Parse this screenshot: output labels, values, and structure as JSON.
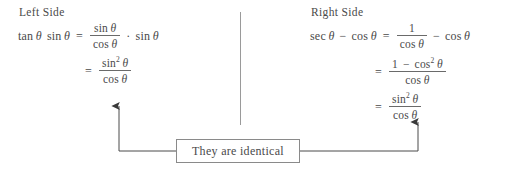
{
  "page": {
    "background_color": "#ffffff",
    "ink_color": "#4a4a4a",
    "rule_color": "#8a8a8a"
  },
  "left": {
    "heading": "Left Side",
    "lines": [
      {
        "lhs": "tan θ sin θ",
        "relation": "=",
        "rhs_text": "(sin θ / cos θ) · sin θ",
        "numerator": "sin θ",
        "denominator": "cos θ",
        "operator": "·",
        "trailing": "sin θ"
      },
      {
        "lhs": "",
        "relation": "=",
        "rhs_text": "sin² θ / cos θ",
        "numerator": "sin² θ",
        "denominator": "cos θ"
      }
    ],
    "tokens": {
      "tan": "tan",
      "sin": "sin",
      "cos": "cos",
      "theta": "θ",
      "equals": "=",
      "cdot": "·",
      "exp2": "2"
    }
  },
  "right": {
    "heading": "Right Side",
    "lines": [
      {
        "lhs": "sec θ − cos θ",
        "relation": "=",
        "rhs_text": "(1 / cos θ) − cos θ",
        "numerator": "1",
        "denominator": "cos θ",
        "operator": "−",
        "trailing": "cos θ"
      },
      {
        "lhs": "",
        "relation": "=",
        "rhs_text": "(1 − cos² θ) / cos θ",
        "numerator_a": "1",
        "numerator_op": "−",
        "numerator_b": "cos² θ",
        "denominator": "cos θ"
      },
      {
        "lhs": "",
        "relation": "=",
        "rhs_text": "sin² θ / cos θ",
        "numerator": "sin² θ",
        "denominator": "cos θ"
      }
    ],
    "tokens": {
      "sec": "sec",
      "sin": "sin",
      "cos": "cos",
      "theta": "θ",
      "equals": "=",
      "minus": "−",
      "one": "1",
      "exp2": "2"
    }
  },
  "conclusion": {
    "label": "They are identical"
  },
  "connectors": {
    "left_arrow_name": "arrow-to-left-side",
    "right_arrow_name": "arrow-to-right-side",
    "direction": "up"
  }
}
